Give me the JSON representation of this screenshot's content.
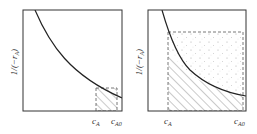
{
  "panels": [
    {
      "id": "left",
      "ylabel": "1/(−r",
      "ylabel_sub": "A",
      "ylabel_close": ")",
      "x_ticks": [
        {
          "main": "c",
          "sub": "A"
        },
        {
          "main": "c",
          "sub": "A0"
        }
      ],
      "shading": "hatched-small-rectangle"
    },
    {
      "id": "right",
      "ylabel": "1/(−r",
      "ylabel_sub": "A",
      "ylabel_close": ")",
      "x_ticks": [
        {
          "main": "c",
          "sub": "A"
        },
        {
          "main": "c",
          "sub": "A0"
        }
      ],
      "shading": "hatched-under-curve-dotted-above"
    }
  ],
  "colors": {
    "axis": "#333333",
    "curve": "#222222",
    "dashed": "#555555",
    "hatch": "#777777",
    "dots": "#999999"
  }
}
